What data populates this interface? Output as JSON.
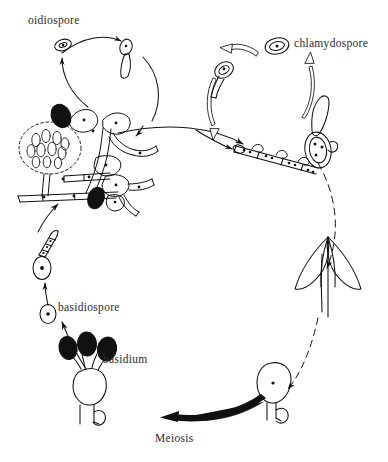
{
  "figure": {
    "kind": "biological-life-cycle-diagram",
    "background_color": "#ffffff",
    "ink_color": "#111111",
    "width": 388,
    "height": 462
  },
  "labels": {
    "oidiospore": "oidiospore",
    "chlamydospore": "chlamydospore",
    "basidiospore": "basidiospore",
    "basidium": "basidium",
    "meiosis": "Meiosis"
  },
  "structures": {
    "sporangium": "dashed-sporangium-head",
    "mycelium": "branching-septate-mycelium",
    "fruiting_body": "basidiocarp-mushroom",
    "basidium_cell": "club-shaped-basidium-with-clamp",
    "basidiospore_count": 3,
    "hyphal_chain": "septate-germinating-hypha"
  },
  "arrows": {
    "main_cycle": "counter-clockwise-thin-arrows",
    "oidiospore_cycle": "thin-arc-arrows",
    "chlamydospore_cycle": "outlined-double-line-arrows",
    "dashed_link": "dashed-arrow-fruiting-body-to-basidium",
    "meiosis_arrow": "thick-black-tapered-arrow"
  }
}
